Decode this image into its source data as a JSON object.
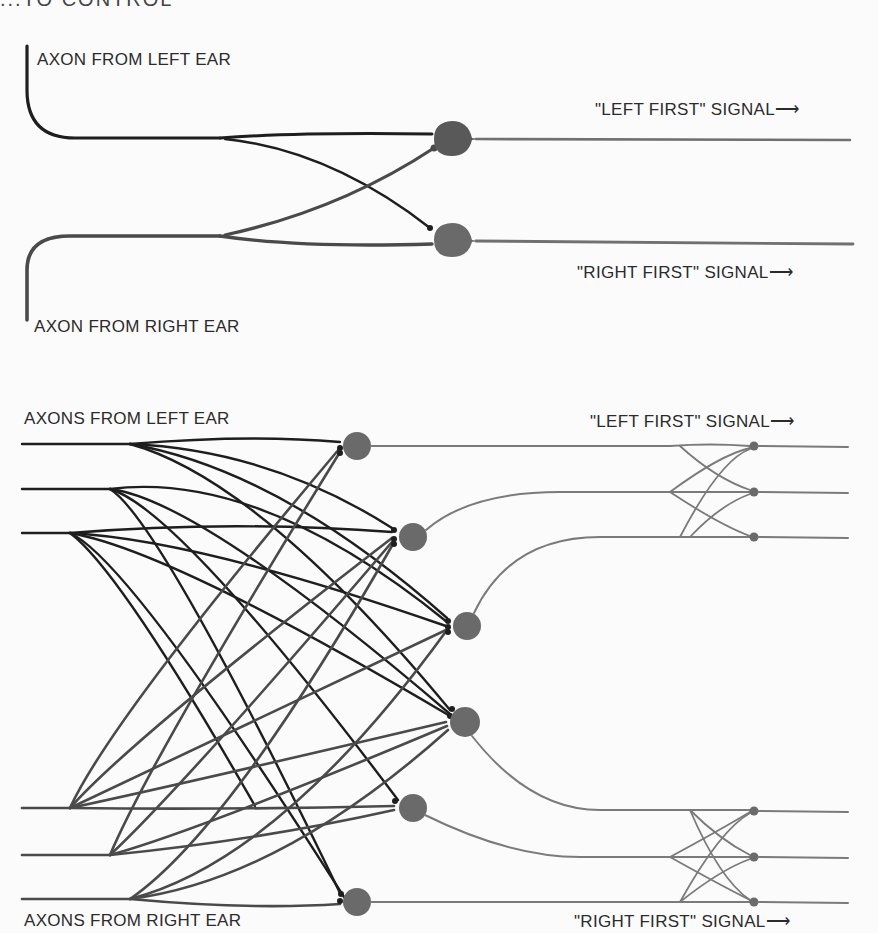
{
  "figure": {
    "truncated_heading": "...TO CONTROL",
    "panel_top": {
      "input_labels": {
        "left": "AXON FROM LEFT EAR",
        "right": "AXON FROM RIGHT EAR"
      },
      "output_labels": {
        "left_first": "\"LEFT FIRST\" SIGNAL",
        "right_first": "\"RIGHT FIRST\" SIGNAL"
      },
      "arrow_glyph": "⟶",
      "neuron_count": 2
    },
    "panel_bottom": {
      "input_labels": {
        "left": "AXONS FROM LEFT EAR",
        "right": "AXONS FROM RIGHT EAR"
      },
      "output_labels": {
        "left_first": "\"LEFT FIRST\" SIGNAL",
        "right_first": "\"RIGHT FIRST\" SIGNAL"
      },
      "arrow_glyph": "⟶",
      "neuron_count": 6,
      "output_terminal_count": 6
    },
    "colors": {
      "left_axon": "#1e1e1e",
      "right_axon": "#4a4a4a",
      "neuron": "#6a6a6a",
      "output_axon": "#7a7a7a",
      "text": "#2b2b2b"
    }
  }
}
